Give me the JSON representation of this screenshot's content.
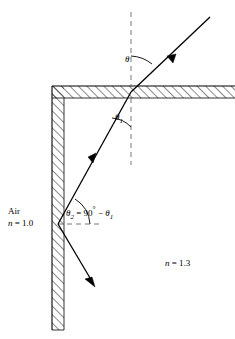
{
  "diagram": {
    "labels": {
      "air": "Air",
      "n_air": "n = 1.0",
      "n_air_symbol": "n",
      "n_air_value": "1.0",
      "n_glass": "n = 1.3",
      "n_glass_symbol": "n",
      "n_glass_value": "1.3",
      "theta": "θ",
      "theta1_symbol": "θ",
      "theta1_sub": "1",
      "theta2_symbol": "θ",
      "theta2_sub": "2",
      "equation_equals": "=",
      "equation_ninety": "90",
      "equation_degree": "°",
      "equation_minus": "−",
      "equation_full": "θ2 = 90° − θ1"
    },
    "colors": {
      "stroke": "#000000",
      "hatch": "#000000",
      "dashed": "#555555",
      "background": "#ffffff"
    },
    "geometry": {
      "top_surface_y": 86,
      "top_surface_thickness": 12,
      "left_wall_x": 52,
      "left_wall_thickness": 12,
      "left_wall_bottom_y": 330,
      "normal_x": 131,
      "incidence_point": [
        131,
        92
      ],
      "exit_point": [
        58,
        224
      ],
      "incident_ray_start": [
        210,
        17
      ],
      "exit_ray_end": [
        95,
        285
      ]
    },
    "icons": [
      "arrow-incident-icon",
      "arrow-refracted-icon",
      "arrow-exit-icon",
      "angle-arc-theta-icon",
      "angle-arc-theta1-icon",
      "angle-arc-theta2-icon"
    ]
  }
}
